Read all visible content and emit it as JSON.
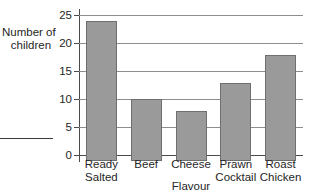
{
  "chart_data": {
    "type": "bar",
    "title": "",
    "categories": [
      "Ready Salted",
      "Beef",
      "Cheese",
      "Prawn Cocktail",
      "Roast Chicken"
    ],
    "category_lines": [
      [
        "Ready",
        "Salted"
      ],
      [
        "Beef",
        ""
      ],
      [
        "Cheese",
        ""
      ],
      [
        "Prawn",
        "Cocktail"
      ],
      [
        "Roast",
        "Chicken"
      ]
    ],
    "values": [
      25,
      11,
      9,
      14,
      19
    ],
    "xlabel": "Flavour",
    "ylabel": "Number of children",
    "ylabel_lines": [
      "Number of",
      "children"
    ],
    "ylim": [
      0,
      25
    ],
    "ytick_labels": [
      "0",
      "5",
      "10",
      "15",
      "20",
      "25"
    ],
    "ytick_values": [
      0,
      5,
      10,
      15,
      20,
      25
    ],
    "grid": "horizontal",
    "legend": "none",
    "bar_color": "#9a9a9a",
    "bar_edge_color": "#6f6f6f",
    "axis_color": "#4a4a4a",
    "grid_color": "#8d8d8d"
  }
}
